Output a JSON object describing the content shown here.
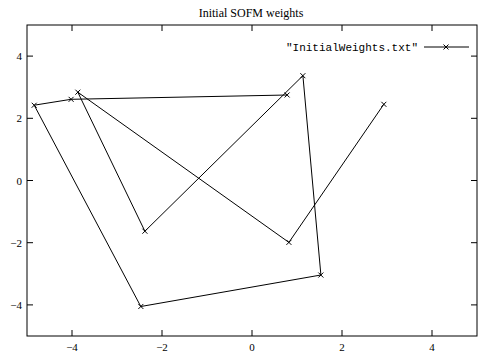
{
  "chart_data": {
    "type": "line",
    "title": "Initial SOFM weights",
    "xlabel": "",
    "ylabel": "",
    "xlim": [
      -5,
      5
    ],
    "ylim": [
      -5,
      5
    ],
    "x_ticks": [
      -4,
      -2,
      0,
      2,
      4
    ],
    "y_ticks": [
      -4,
      -2,
      0,
      2,
      4
    ],
    "x_tick_labels": [
      "−4",
      "−2",
      "0",
      "2",
      "4"
    ],
    "y_tick_labels": [
      "4",
      "2",
      "0",
      "−2",
      "−4"
    ],
    "grid": false,
    "legend_position": "top-right",
    "series": [
      {
        "name": "\"InitialWeights.txt\"",
        "marker": "x",
        "color": "#000000",
        "x": [
          0.78,
          -4.02,
          -4.84,
          -2.47,
          1.53,
          1.13,
          -2.38,
          -3.87,
          0.82,
          2.93
        ],
        "y": [
          2.75,
          2.61,
          2.42,
          -4.05,
          -3.04,
          3.37,
          -1.63,
          2.84,
          -1.99,
          2.45
        ]
      }
    ]
  }
}
